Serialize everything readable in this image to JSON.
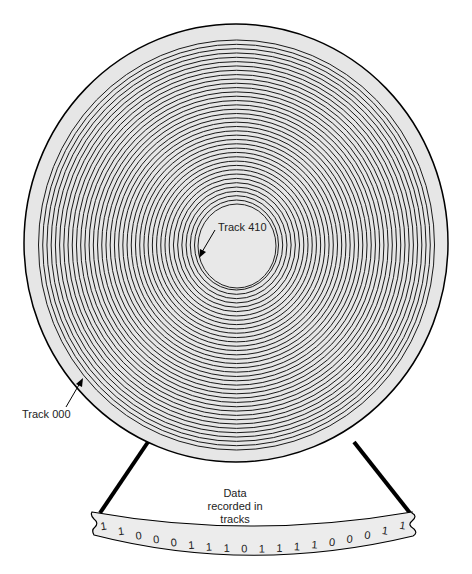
{
  "diagram": {
    "type": "disk-tracks",
    "colors": {
      "disk_fill": "#e6e6e6",
      "track_line": "#1a1a1a",
      "strip_fill": "#ececec",
      "outline": "#000000"
    },
    "labels": {
      "inner_track": "Track 410",
      "outer_track": "Track 000",
      "data_caption_line1": "Data",
      "data_caption_line2": "recorded in",
      "data_caption_line3": "tracks"
    },
    "bits": [
      "1",
      "1",
      "0",
      "0",
      "0",
      "1",
      "1",
      "1",
      "0",
      "1",
      "1",
      "1",
      "1",
      "0",
      "0",
      "0",
      "1",
      "1"
    ],
    "track_count": 38
  }
}
